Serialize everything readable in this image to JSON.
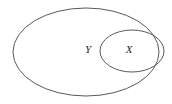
{
  "diagram": {
    "type": "euler-diagram",
    "background_color": "#ffffff",
    "stroke_color": "#5a5a5a",
    "label_color": "#2b2b2b",
    "relation": "X is a subset of Y",
    "sets": [
      {
        "id": "outer",
        "label": "Y",
        "shape": "ellipse",
        "center_x": 86,
        "center_y": 52,
        "radius_x": 73,
        "radius_y": 44,
        "label_x": 88,
        "label_y": 50
      },
      {
        "id": "inner",
        "label": "X",
        "shape": "ellipse",
        "center_x": 132,
        "center_y": 51,
        "radius_x": 32,
        "radius_y": 21,
        "label_x": 129,
        "label_y": 50
      }
    ]
  }
}
